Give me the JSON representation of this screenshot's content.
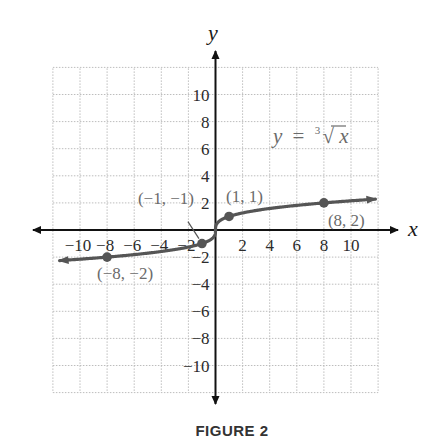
{
  "chart_data": {
    "type": "line",
    "title": "",
    "caption": "FIGURE 2",
    "xlabel": "x",
    "ylabel": "y",
    "xlim": [
      -12,
      12
    ],
    "ylim": [
      -12,
      12
    ],
    "grid": true,
    "grid_step": 2,
    "x_ticks": [
      -10,
      -8,
      -6,
      -4,
      -2,
      2,
      4,
      6,
      8,
      10
    ],
    "x_tick_labels": [
      "−10",
      "−8",
      "−6",
      "−4",
      "−2",
      "2",
      "4",
      "6",
      "8",
      "10"
    ],
    "y_ticks": [
      10,
      8,
      6,
      4,
      2,
      -2,
      -4,
      -6,
      -8,
      -10
    ],
    "y_tick_labels": [
      "10",
      "8",
      "6",
      "4",
      "2",
      "−2",
      "−4",
      "−6",
      "−8",
      "−10"
    ],
    "series": [
      {
        "name": "y = cube root of x",
        "function": "cbrt(x)",
        "x_range": [
          -11.5,
          11.8
        ],
        "arrows": "both",
        "color": "#555555"
      }
    ],
    "points": [
      {
        "x": -8,
        "y": -2,
        "label": "(−8, −2)"
      },
      {
        "x": -1,
        "y": -1,
        "label": "(−1, −1)"
      },
      {
        "x": 1,
        "y": 1,
        "label": "(1, 1)"
      },
      {
        "x": 8,
        "y": 2,
        "label": "(8, 2)"
      }
    ],
    "equation": {
      "lhs": "y",
      "equals": "=",
      "index": "3",
      "radical": "√",
      "radicand": "x"
    },
    "colors": {
      "axis": "#111111",
      "curve": "#555555",
      "grid": "#bdbdbd",
      "label": "#6b6b6b"
    }
  }
}
